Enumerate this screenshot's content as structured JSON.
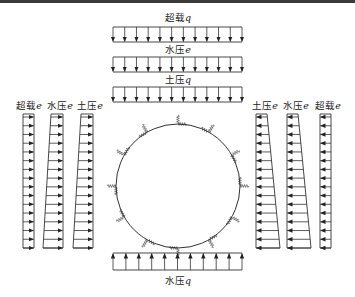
{
  "diagram": {
    "colors": {
      "line": "#333333",
      "background": "#ffffff",
      "border": "#3a3a3a"
    },
    "top_loads": [
      {
        "id": "surcharge-q",
        "label_main": "超载",
        "label_symbol": "q",
        "direction": "down",
        "arrow_count": 12
      },
      {
        "id": "water-pressure-e-top",
        "label_main": "水压",
        "label_symbol": "e",
        "direction": "down",
        "arrow_count": 12
      },
      {
        "id": "earth-pressure-q",
        "label_main": "土压",
        "label_symbol": "q",
        "direction": "down",
        "arrow_count": 12
      }
    ],
    "left_loads": [
      {
        "id": "surcharge-e-left",
        "label_main": "超载",
        "label_symbol": "e",
        "direction": "right",
        "shape": "rectangle",
        "arrow_count": 16
      },
      {
        "id": "water-pressure-e-left",
        "label_main": "水压",
        "label_symbol": "e",
        "direction": "right",
        "shape": "trapezoid",
        "arrow_count": 16
      },
      {
        "id": "earth-pressure-e-left",
        "label_main": "土压",
        "label_symbol": "e",
        "direction": "right",
        "shape": "trapezoid",
        "arrow_count": 16
      }
    ],
    "right_loads": [
      {
        "id": "earth-pressure-e-right",
        "label_main": "土压",
        "label_symbol": "e",
        "direction": "left",
        "shape": "trapezoid",
        "arrow_count": 16
      },
      {
        "id": "water-pressure-e-right",
        "label_main": "水压",
        "label_symbol": "e",
        "direction": "left",
        "shape": "trapezoid",
        "arrow_count": 16
      },
      {
        "id": "surcharge-e-right",
        "label_main": "超载",
        "label_symbol": "e",
        "direction": "left",
        "shape": "rectangle",
        "arrow_count": 16
      }
    ],
    "bottom_loads": [
      {
        "id": "water-pressure-q-bottom",
        "label_main": "水压",
        "label_symbol": "q",
        "direction": "up",
        "arrow_count": 11
      }
    ],
    "lining": {
      "shape": "circle",
      "spring_count": 12
    }
  }
}
